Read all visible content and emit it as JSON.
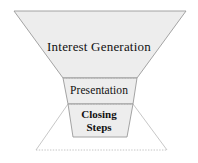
{
  "diagram": {
    "type": "funnel",
    "background_color": "#ffffff",
    "stages": [
      {
        "id": "interest-generation",
        "label": "Interest Generation",
        "order": 1,
        "fill_color": "#ededed",
        "stroke_color": "#999999",
        "text_color": "#111111",
        "bold": false,
        "shape": "trapezoid",
        "top_width_px": 172,
        "bottom_width_px": 74,
        "top_y_px": 11,
        "bottom_y_px": 78
      },
      {
        "id": "presentation",
        "label": "Presentation",
        "order": 2,
        "fill_color": "#ededed",
        "stroke_color": "#999999",
        "text_color": "#111111",
        "bold": false,
        "shape": "trapezoid",
        "top_width_px": 74,
        "bottom_width_px": 65,
        "top_y_px": 78,
        "bottom_y_px": 104
      },
      {
        "id": "closing-steps",
        "label": "Closing Steps",
        "label_line_1": "Closing",
        "label_line_2": "Steps",
        "order": 3,
        "fill_color": "#ededed",
        "stroke_color": "#999999",
        "text_color": "#111111",
        "bold": true,
        "shape": "trapezoid",
        "top_width_px": 65,
        "bottom_width_px": 54,
        "top_y_px": 104,
        "bottom_y_px": 137
      }
    ],
    "outer_outline": {
      "id": "projection-outline",
      "style": "thin-solid-and-dotted",
      "stroke_color": "#b9b9b9",
      "dotted_stroke_color": "#bdbdbd",
      "top_left_x_px": 68,
      "top_right_x_px": 133,
      "top_y_px": 104,
      "bottom_left_x_px": 36,
      "bottom_right_x_px": 167,
      "bottom_y_px": 150
    },
    "divider_lines": [
      {
        "id": "divider-interest-presentation",
        "y_px": 78,
        "style": "dotted",
        "color": "#b0b0b0"
      },
      {
        "id": "divider-presentation-closing",
        "y_px": 104,
        "style": "dotted",
        "color": "#b0b0b0"
      },
      {
        "id": "divider-bottom",
        "y_px": 150,
        "style": "dotted",
        "color": "#bdbdbd"
      }
    ]
  }
}
